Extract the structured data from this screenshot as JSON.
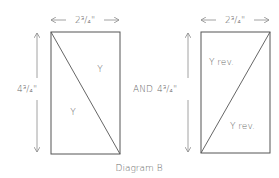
{
  "diagram": {
    "caption": "Diagram B",
    "connector": "AND",
    "colors": {
      "line": "#555555",
      "arrow": "#8a8a8a",
      "text": "#6a6a6a"
    },
    "left_panel": {
      "width_label": "2³/₄\"",
      "height_label": "4³/₄\"",
      "diagonal": "top-left to bottom-right",
      "upper_label": "Y",
      "lower_label": "Y"
    },
    "right_panel": {
      "width_label": "2³/₄\"",
      "height_label": "4³/₄\"",
      "diagonal": "bottom-left to top-right",
      "upper_label": "Y rev.",
      "lower_label": "Y rev."
    }
  }
}
